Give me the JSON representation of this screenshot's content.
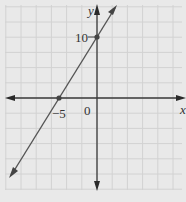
{
  "chart_data": {
    "type": "line",
    "title": "",
    "xlabel": "x",
    "ylabel": "y",
    "series": [
      {
        "name": "line",
        "x": [
          -5,
          0
        ],
        "y": [
          0,
          10
        ],
        "slope": 2,
        "intercept": 10
      }
    ],
    "points": [
      {
        "x": -5,
        "y": 0,
        "label": "-5"
      },
      {
        "x": 0,
        "y": 10,
        "label": "10"
      }
    ],
    "annotations": [
      "-5",
      "0",
      "10"
    ],
    "grid": true,
    "xlim": [
      -12.5,
      11
    ],
    "ylim": [
      -12,
      12.5
    ],
    "legend": "none"
  },
  "labels": {
    "x_axis": "x",
    "y_axis": "y",
    "origin": "0",
    "x_intercept": "−5",
    "y_intercept": "10"
  },
  "colors": {
    "background": "#e9e9e9",
    "grid": "#d2d2d2",
    "axis": "#3a3a3a",
    "line": "#555555",
    "point": "#444444"
  }
}
